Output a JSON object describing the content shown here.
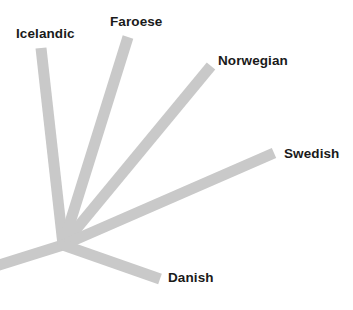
{
  "figure": {
    "type": "unrooted-phylogenetic-tree",
    "background_color": "#ffffff",
    "branch_color": "#c9c9c9",
    "label_color": "#1a1a1a",
    "width": 353,
    "height": 310
  },
  "labels": {
    "icelandic": "Icelandic",
    "faroese": "Faroese",
    "norwegian": "Norwegian",
    "swedish": "Swedish",
    "danish": "Danish"
  },
  "chart_data": {
    "type": "tree",
    "title": "",
    "xlabel": "",
    "ylabel": "",
    "node": {
      "x": 63,
      "y": 245
    },
    "branch_width": 11,
    "branches": [
      {
        "name": "Icelandic",
        "x1": 63,
        "y1": 245,
        "x2": 41,
        "y2": 48,
        "length": 198
      },
      {
        "name": "Faroese",
        "x1": 63,
        "y1": 245,
        "x2": 128,
        "y2": 37,
        "length": 218
      },
      {
        "name": "Norwegian",
        "x1": 63,
        "y1": 245,
        "x2": 211,
        "y2": 66,
        "length": 232
      },
      {
        "name": "Swedish",
        "x1": 63,
        "y1": 245,
        "x2": 274,
        "y2": 153,
        "length": 230
      },
      {
        "name": "Danish",
        "x1": 63,
        "y1": 245,
        "x2": 160,
        "y2": 279,
        "length": 103
      },
      {
        "name": "root",
        "x1": 63,
        "y1": 245,
        "x2": -4,
        "y2": 266,
        "length": 70
      }
    ],
    "label_positions": [
      {
        "name": "Icelandic",
        "x": 16,
        "y": 27
      },
      {
        "name": "Faroese",
        "x": 110,
        "y": 15
      },
      {
        "name": "Norwegian",
        "x": 218,
        "y": 54
      },
      {
        "name": "Swedish",
        "x": 284,
        "y": 147
      },
      {
        "name": "Danish",
        "x": 168,
        "y": 271
      }
    ]
  }
}
